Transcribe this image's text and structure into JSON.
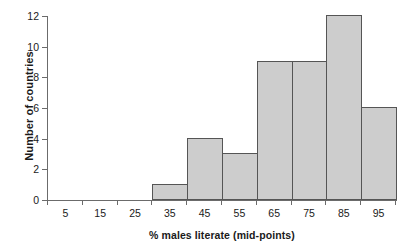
{
  "chart_data": {
    "type": "bar",
    "title": "",
    "xlabel": "% males literate (mid-points)",
    "ylabel": "Number of countries",
    "categories": [
      "5",
      "15",
      "25",
      "35",
      "45",
      "55",
      "65",
      "75",
      "85",
      "95"
    ],
    "values": [
      0,
      0,
      0,
      1,
      4,
      3,
      9,
      9,
      12,
      6
    ],
    "xtick_labels": [
      "5",
      "15",
      "25",
      "35",
      "45",
      "55",
      "65",
      "75",
      "85",
      "95"
    ],
    "ytick_labels": [
      "0",
      "2",
      "4",
      "6",
      "8",
      "10",
      "12"
    ],
    "ytick_values": [
      0,
      2,
      4,
      6,
      8,
      10,
      12
    ],
    "ylim": [
      0,
      12
    ],
    "xlim": [
      0,
      100
    ],
    "bin_width": 10,
    "grid": false,
    "legend": false,
    "bar_fill_color": "#cdcdcd",
    "bar_edge_color": "#555555",
    "axis_color": "#6b6b6b",
    "background_color": "#ffffff"
  }
}
